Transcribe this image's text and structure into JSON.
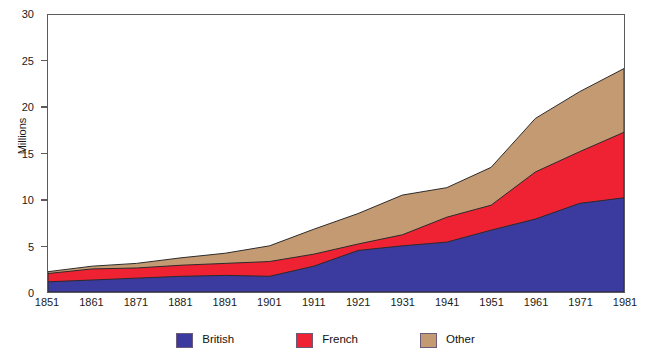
{
  "chart_data": {
    "type": "area",
    "title": "",
    "subtitle": "",
    "xlabel": "",
    "ylabel": "Millions",
    "stacked": true,
    "grid": false,
    "legend_position": "bottom",
    "xlim": [
      1851,
      1981
    ],
    "ylim": [
      0,
      30
    ],
    "yticks": [
      0,
      5,
      10,
      15,
      20,
      25,
      30
    ],
    "ytick_labels": [
      "0",
      "5",
      "10",
      "15",
      "20",
      "25",
      "30"
    ],
    "categories": [
      1851,
      1861,
      1871,
      1881,
      1891,
      1901,
      1911,
      1921,
      1931,
      1941,
      1951,
      1961,
      1971,
      1981
    ],
    "xtick_labels": [
      "1851",
      "1861",
      "1871",
      "1881",
      "1891",
      "1901",
      "1911",
      "1921",
      "1931",
      "1941",
      "1951",
      "1961",
      "1971",
      "1981"
    ],
    "series": [
      {
        "name": "British",
        "color": "#3b3a9e",
        "values": [
          1.1,
          1.3,
          1.5,
          1.7,
          1.8,
          1.7,
          2.8,
          4.5,
          5.0,
          5.4,
          6.7,
          7.9,
          9.6,
          10.2
        ]
      },
      {
        "name": "French",
        "color": "#ee2233",
        "values": [
          0.9,
          1.2,
          1.1,
          1.2,
          1.3,
          1.6,
          1.3,
          0.7,
          1.2,
          2.7,
          2.7,
          5.1,
          5.6,
          7.1
        ]
      },
      {
        "name": "Other",
        "color": "#c49a72",
        "values": [
          0.2,
          0.3,
          0.5,
          0.8,
          1.1,
          1.7,
          2.7,
          3.3,
          4.3,
          3.2,
          4.1,
          5.8,
          6.5,
          6.9
        ]
      }
    ],
    "stack_tops": {
      "british": [
        1.1,
        1.3,
        1.5,
        1.7,
        1.8,
        1.7,
        2.8,
        4.5,
        5.0,
        5.4,
        6.7,
        7.9,
        9.6,
        10.2
      ],
      "british_plus_french": [
        2.0,
        2.5,
        2.6,
        2.9,
        3.1,
        3.3,
        4.1,
        5.2,
        6.2,
        8.1,
        9.4,
        13.0,
        15.2,
        17.3
      ],
      "total": [
        2.2,
        2.8,
        3.1,
        3.7,
        4.2,
        5.0,
        6.8,
        8.5,
        10.5,
        11.3,
        13.5,
        18.8,
        21.7,
        24.2
      ]
    }
  },
  "axes": {
    "y_title": "Millions"
  },
  "legend": {
    "items": [
      {
        "label": "British",
        "color": "#3b3a9e",
        "swatch_name": "legend-swatch-british"
      },
      {
        "label": "French",
        "color": "#ee2233",
        "swatch_name": "legend-swatch-french"
      },
      {
        "label": "Other",
        "color": "#c49a72",
        "swatch_name": "legend-swatch-other"
      }
    ]
  },
  "colors": {
    "british": "#3b3a9e",
    "french": "#ee2233",
    "other": "#c49a72",
    "axis": "#5b5b5b",
    "text": "#1a1a1a",
    "background": "#ffffff",
    "area_outline": "#2a2a2a"
  }
}
